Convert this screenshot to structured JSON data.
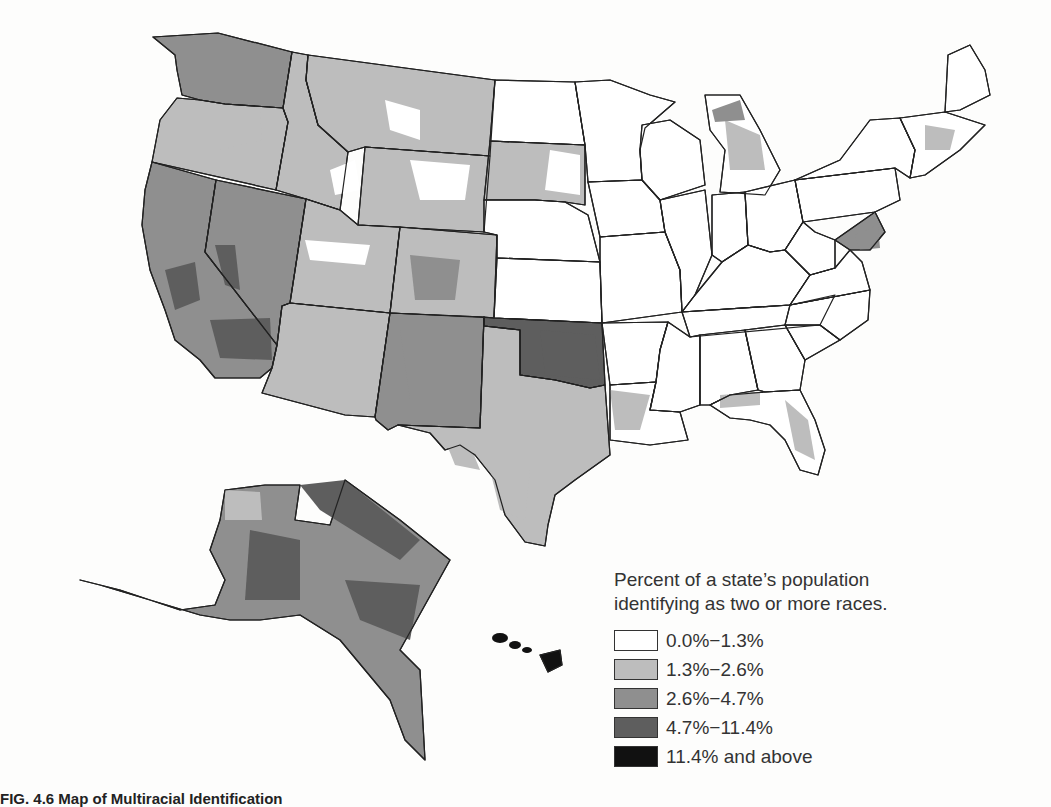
{
  "legend": {
    "title": "Percent of a state’s population identifying as two or more races.",
    "classes": [
      {
        "label": "0.0%−1.3%",
        "color": "#ffffff"
      },
      {
        "label": "1.3%−2.6%",
        "color": "#bdbdbd"
      },
      {
        "label": "2.6%−4.7%",
        "color": "#8f8f8f"
      },
      {
        "label": "4.7%−11.4%",
        "color": "#5e5e5e"
      },
      {
        "label": "11.4% and above",
        "color": "#111111"
      }
    ]
  },
  "caption": "FIG. 4.6 Map of Multiracial Identification",
  "map_data": {
    "title": "Percent of a state’s population identifying as two or more races",
    "regions": [
      {
        "name": "Washington",
        "class": 2
      },
      {
        "name": "Oregon",
        "class": 1
      },
      {
        "name": "California",
        "class": 2
      },
      {
        "name": "Nevada",
        "class": 2
      },
      {
        "name": "Idaho",
        "class": 1
      },
      {
        "name": "Montana",
        "class": 1
      },
      {
        "name": "Wyoming",
        "class": 1
      },
      {
        "name": "Utah",
        "class": 1
      },
      {
        "name": "Arizona",
        "class": 1
      },
      {
        "name": "Colorado",
        "class": 1
      },
      {
        "name": "New Mexico",
        "class": 2
      },
      {
        "name": "North Dakota",
        "class": 0
      },
      {
        "name": "South Dakota",
        "class": 1
      },
      {
        "name": "Nebraska",
        "class": 0
      },
      {
        "name": "Kansas",
        "class": 0
      },
      {
        "name": "Oklahoma",
        "class": 3
      },
      {
        "name": "Texas",
        "class": 1
      },
      {
        "name": "Minnesota",
        "class": 0
      },
      {
        "name": "Iowa",
        "class": 0
      },
      {
        "name": "Missouri",
        "class": 0
      },
      {
        "name": "Arkansas",
        "class": 0
      },
      {
        "name": "Louisiana",
        "class": 0
      },
      {
        "name": "Wisconsin",
        "class": 0
      },
      {
        "name": "Illinois",
        "class": 0
      },
      {
        "name": "Michigan",
        "class": 0
      },
      {
        "name": "Indiana",
        "class": 0
      },
      {
        "name": "Ohio",
        "class": 0
      },
      {
        "name": "Kentucky",
        "class": 0
      },
      {
        "name": "Tennessee",
        "class": 0
      },
      {
        "name": "Mississippi",
        "class": 0
      },
      {
        "name": "Alabama",
        "class": 0
      },
      {
        "name": "Georgia",
        "class": 0
      },
      {
        "name": "Florida",
        "class": 0
      },
      {
        "name": "South Carolina",
        "class": 0
      },
      {
        "name": "North Carolina",
        "class": 0
      },
      {
        "name": "Virginia",
        "class": 0
      },
      {
        "name": "West Virginia",
        "class": 0
      },
      {
        "name": "Pennsylvania",
        "class": 0
      },
      {
        "name": "New York",
        "class": 0
      },
      {
        "name": "Maryland",
        "class": 2
      },
      {
        "name": "New England",
        "class": 0
      },
      {
        "name": "Maine",
        "class": 0
      },
      {
        "name": "Alaska",
        "class": 2
      },
      {
        "name": "Hawaii",
        "class": 4
      }
    ]
  }
}
